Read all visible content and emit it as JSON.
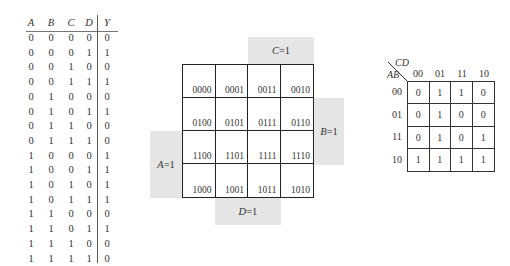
{
  "truth_table": {
    "headers": [
      "A",
      "B",
      "C",
      "D",
      "Y"
    ],
    "rows": [
      [
        "0",
        "0",
        "0",
        "0",
        "0"
      ],
      [
        "0",
        "0",
        "0",
        "1",
        "1"
      ],
      [
        "0",
        "0",
        "1",
        "0",
        "0"
      ],
      [
        "0",
        "0",
        "1",
        "1",
        "1"
      ],
      [
        "0",
        "1",
        "0",
        "0",
        "0"
      ],
      [
        "0",
        "1",
        "0",
        "1",
        "1"
      ],
      [
        "0",
        "1",
        "1",
        "0",
        "0"
      ],
      [
        "0",
        "1",
        "1",
        "1",
        "0"
      ],
      [
        "1",
        "0",
        "0",
        "0",
        "1"
      ],
      [
        "1",
        "0",
        "0",
        "1",
        "1"
      ],
      [
        "1",
        "0",
        "1",
        "0",
        "1"
      ],
      [
        "1",
        "0",
        "1",
        "1",
        "1"
      ],
      [
        "1",
        "1",
        "0",
        "0",
        "0"
      ],
      [
        "1",
        "1",
        "0",
        "1",
        "1"
      ],
      [
        "1",
        "1",
        "1",
        "0",
        "0"
      ],
      [
        "1",
        "1",
        "1",
        "1",
        "0"
      ]
    ]
  },
  "kmap_layout": {
    "region_labels": {
      "c": {
        "var": "C",
        "eq": "=1"
      },
      "b": {
        "var": "B",
        "eq": "=1"
      },
      "a": {
        "var": "A",
        "eq": "=1"
      },
      "d": {
        "var": "D",
        "eq": "=1"
      }
    },
    "cells": [
      "0000",
      "0001",
      "0011",
      "0010",
      "0100",
      "0101",
      "0111",
      "0110",
      "1100",
      "1101",
      "1111",
      "1110",
      "1000",
      "1001",
      "1011",
      "1010"
    ]
  },
  "kmap_values": {
    "col_var": "CD",
    "row_var": "AB",
    "col_headers": [
      "00",
      "01",
      "11",
      "10"
    ],
    "row_headers": [
      "00",
      "01",
      "11",
      "10"
    ],
    "cells": [
      "0",
      "1",
      "1",
      "0",
      "0",
      "1",
      "0",
      "0",
      "0",
      "1",
      "0",
      "1",
      "1",
      "1",
      "1",
      "1"
    ]
  }
}
